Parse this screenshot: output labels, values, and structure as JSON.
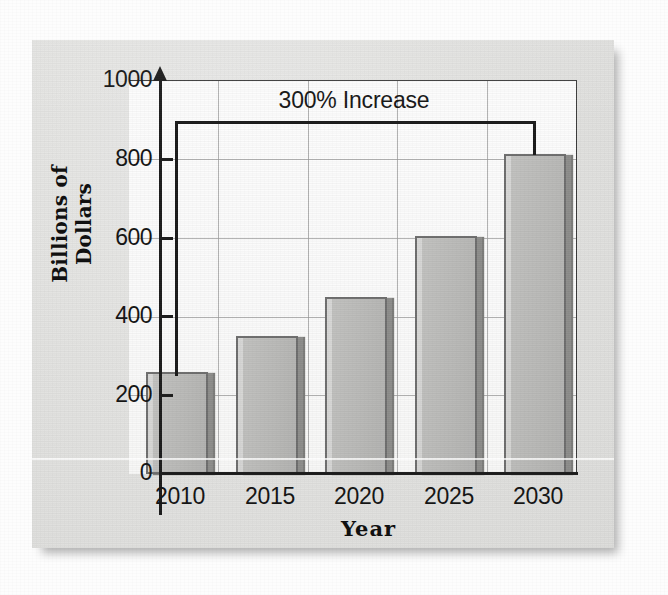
{
  "chart_data": {
    "type": "bar",
    "title": "",
    "xlabel": "Year",
    "ylabel": "Billions of Dollars",
    "categories": [
      "2010",
      "2015",
      "2020",
      "2025",
      "2030"
    ],
    "values": [
      260,
      350,
      450,
      605,
      815
    ],
    "ylim": [
      0,
      1000
    ],
    "y_ticks": [
      "0",
      "200",
      "400",
      "600",
      "800",
      "1000"
    ],
    "y_tick_values": [
      0,
      200,
      400,
      600,
      800,
      1000
    ],
    "grid": "horizontal-and-vertical",
    "legend": "none",
    "annotations": [
      {
        "text": "300% Increase",
        "from_category": "2010",
        "to_category": "2030",
        "style": "bracket"
      }
    ],
    "colors": {
      "bar_fill": "#bdbdbb",
      "bar_edge": "#6e6e6e",
      "bar_shadow": "#8d8d8b",
      "axis": "#1c1c1c",
      "grid": "#9a9a9a",
      "plot_background": "#fafafa",
      "page_background": "#e2e2e0",
      "text": "#141414"
    }
  },
  "axis": {
    "y_title": "Billions of Dollars",
    "x_title": "Year",
    "y_labels": {
      "t1000": "1000",
      "t800": "800",
      "t600": "600",
      "t400": "400",
      "t200": "200",
      "t0": "0"
    },
    "x_labels": {
      "c0": "2010",
      "c1": "2015",
      "c2": "2020",
      "c3": "2025",
      "c4": "2030"
    }
  },
  "annotation": {
    "label": "300% Increase"
  }
}
